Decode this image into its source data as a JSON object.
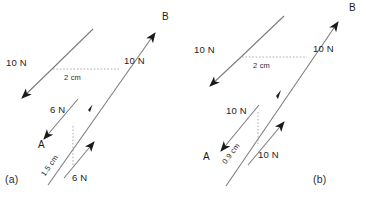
{
  "figure": {
    "type": "physics-force-couple-diagram",
    "background_color": "#ffffff",
    "line_color": "#6e6e6e",
    "text_color": "#232323",
    "dimension_line_color": "#9a9a9a"
  },
  "panels": [
    {
      "id": "a",
      "caption": "(a)",
      "upper_line": {
        "force_label_left": "10 N",
        "force_label_right": "10 N",
        "arrow_tip_label": "B"
      },
      "lower_line": {
        "force_label_left": "6 N",
        "force_label_right": "6 N",
        "arrow_tip_label": "A"
      },
      "dimensions": [
        {
          "name": "upper-separation",
          "value": "2 cm",
          "orientation": "horizontal"
        },
        {
          "name": "lower-separation",
          "value": "1.5 cm",
          "orientation": "rotated"
        }
      ]
    },
    {
      "id": "b",
      "caption": "(b)",
      "upper_line": {
        "force_label_left": "10 N",
        "force_label_right": "10 N",
        "arrow_tip_label": "B"
      },
      "lower_line": {
        "force_label_left": "10 N",
        "force_label_right": "10 N",
        "arrow_tip_label": "A"
      },
      "dimensions": [
        {
          "name": "upper-separation",
          "value": "2 cm",
          "orientation": "horizontal"
        },
        {
          "name": "lower-separation",
          "value": "0.9 cm",
          "orientation": "rotated"
        }
      ]
    }
  ]
}
